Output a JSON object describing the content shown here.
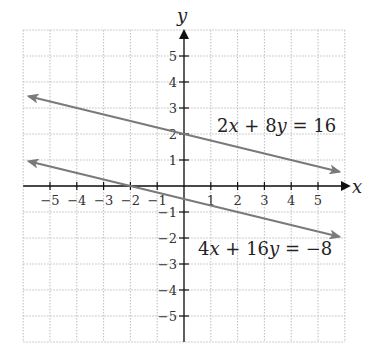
{
  "chart_data": {
    "type": "line",
    "title": "",
    "xlabel": "x",
    "ylabel": "y",
    "xlim": [
      -6,
      6
    ],
    "ylim": [
      -6,
      6
    ],
    "grid": true,
    "x_ticks": [
      -5,
      -4,
      -3,
      -2,
      -1,
      1,
      2,
      3,
      4,
      5
    ],
    "y_ticks": [
      5,
      4,
      3,
      2,
      1,
      -1,
      -2,
      -3,
      -4,
      -5
    ],
    "x_tick_labels": [
      "−5",
      "−4",
      "−3",
      "−2",
      "−1",
      "1",
      "2",
      "3",
      "4",
      "5"
    ],
    "y_tick_labels": [
      "5",
      "4",
      "3",
      "2",
      "1",
      "−1",
      "−2",
      "−3",
      "−4",
      "−5"
    ],
    "series": [
      {
        "name": "2x + 8y = 16",
        "equation": "2x + 8y = 16",
        "slope": -0.25,
        "intercept": 2,
        "x": [
          -5.8,
          5.8
        ],
        "y": [
          3.45,
          0.55
        ],
        "arrows": "both",
        "color": "#7a7a7a"
      },
      {
        "name": "4x + 16y = −8",
        "equation": "4x + 16y = −8",
        "slope": -0.25,
        "intercept": -0.5,
        "x": [
          -5.8,
          5.8
        ],
        "y": [
          0.95,
          -1.95
        ],
        "arrows": "both",
        "color": "#7a7a7a"
      }
    ],
    "annotations": [
      {
        "text": "2x + 8y = 16",
        "x": 1.2,
        "y": 2.2
      },
      {
        "text": "4x + 16y = −8",
        "x": 0.5,
        "y": -2.5
      }
    ]
  },
  "labels": {
    "x_axis": "x",
    "y_axis": "y",
    "eq1": {
      "a": "2",
      "v1": "x",
      "op": " + 8",
      "v2": "y",
      "rhs": " = 16"
    },
    "eq2": {
      "a": "4",
      "v1": "x",
      "op": " + 16",
      "v2": "y",
      "rhs": " =  −8"
    }
  },
  "colors": {
    "line": "#7a7a7a",
    "axis": "#111111",
    "grid": "#bdbdbd"
  }
}
